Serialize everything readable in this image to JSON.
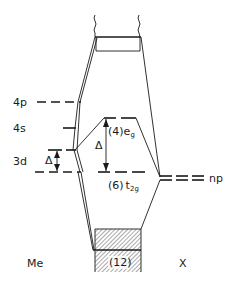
{
  "diagram": {
    "type": "molecular-orbital-energy-level-diagram",
    "columns": {
      "left_label": "Me",
      "right_label": "X"
    },
    "metal_levels": [
      {
        "label": "4p",
        "y": 102
      },
      {
        "label": "4s",
        "y": 128
      },
      {
        "label": "3d",
        "y": 161
      }
    ],
    "metal_splitting_label": "Δ",
    "complex_levels": {
      "eg": {
        "prefix": "(4)",
        "symbol": "e",
        "subscript": "g"
      },
      "t2g": {
        "prefix": "(6)",
        "symbol": "t",
        "subscript": "2g"
      },
      "splitting_label": "Δ",
      "bonding_band_label": "(12)"
    },
    "ligand_levels": {
      "label": "np"
    },
    "colors": {
      "line": "#1a1a1a",
      "background": "#ffffff",
      "hatch": "#555555"
    }
  }
}
